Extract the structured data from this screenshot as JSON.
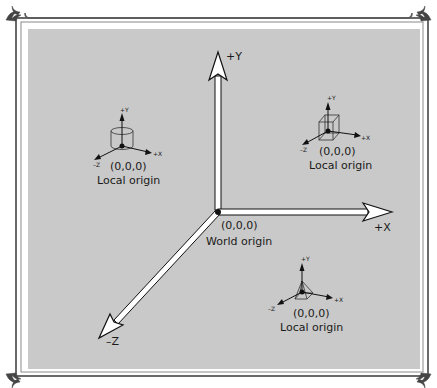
{
  "colors": {
    "panel": "#c9c9c9",
    "border": "#5a5a5a",
    "axis_fill": "#ffffff",
    "axis_stroke": "#111111",
    "text": "#1a1a1a"
  },
  "world_axes": {
    "origin_label": "(0,0,0)",
    "origin_caption": "World origin",
    "x_label": "+X",
    "y_label": "+Y",
    "z_label": "–Z"
  },
  "local_frames": [
    {
      "object": "cylinder",
      "origin_label": "(0,0,0)",
      "caption": "Local origin",
      "x_label": "+X",
      "y_label": "+Y",
      "z_label": "–Z"
    },
    {
      "object": "box",
      "origin_label": "(0,0,0)",
      "caption": "Local origin",
      "x_label": "+X",
      "y_label": "+Y",
      "z_label": "–Z"
    },
    {
      "object": "pyramid",
      "origin_label": "(0,0,0)",
      "caption": "Local origin",
      "x_label": "+X",
      "y_label": "+Y",
      "z_label": "–Z"
    }
  ]
}
